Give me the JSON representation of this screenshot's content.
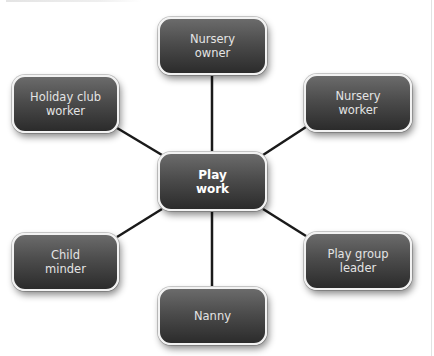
{
  "diagram": {
    "type": "hub-and-spoke",
    "center": {
      "id": "play-work",
      "label": "Play\nwork"
    },
    "nodes": [
      {
        "id": "nursery-owner",
        "label": "Nursery\nowner",
        "x": 158,
        "y": 17,
        "w": 109,
        "h": 58
      },
      {
        "id": "holiday-club-worker",
        "label": "Holiday club\nworker",
        "x": 12,
        "y": 75,
        "w": 107,
        "h": 58
      },
      {
        "id": "nursery-worker",
        "label": "Nursery\nworker",
        "x": 304,
        "y": 74,
        "w": 108,
        "h": 58
      },
      {
        "id": "child-minder",
        "label": "Child\nminder",
        "x": 12,
        "y": 233,
        "w": 107,
        "h": 58
      },
      {
        "id": "play-group-leader",
        "label": "Play group\nleader",
        "x": 304,
        "y": 232,
        "w": 108,
        "h": 58
      },
      {
        "id": "nanny",
        "label": "Nanny",
        "x": 158,
        "y": 287,
        "w": 109,
        "h": 58
      }
    ],
    "center_box": {
      "x": 158,
      "y": 152,
      "w": 109,
      "h": 59
    },
    "colors": {
      "node_fill_top": "#6b6b6b",
      "node_fill_bottom": "#2b2b2b",
      "node_border": "#f2f2f2",
      "connector": "#1a1a1a",
      "text": "#e4e4e4",
      "background": "#ffffff"
    }
  }
}
